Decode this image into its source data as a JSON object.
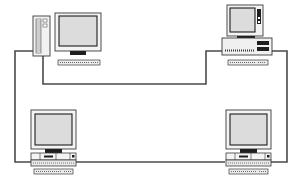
{
  "diagram": {
    "type": "network-topology",
    "topology": "ring",
    "colors": {
      "background": "#ffffff",
      "cable": "#4a4a4a",
      "outline": "#3a3a3a",
      "screen": "#dcdcdc",
      "case": "#f2f2f2",
      "dark": "#1e1e1e"
    },
    "nodes": [
      {
        "id": "node-top-left",
        "kind": "tower-workstation"
      },
      {
        "id": "node-top-right",
        "kind": "desktop-workstation"
      },
      {
        "id": "node-bottom-left",
        "kind": "workstation"
      },
      {
        "id": "node-bottom-right",
        "kind": "workstation"
      }
    ]
  }
}
